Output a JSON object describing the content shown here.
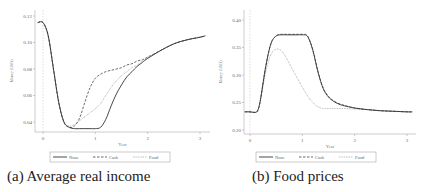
{
  "captions": {
    "a": "(a) Average real income",
    "b": "(b) Food prices"
  },
  "chart_data": [
    {
      "type": "line",
      "title": "(a) Average real income",
      "xlabel": "Year",
      "ylabel": "Money (USD)",
      "xlim": [
        -0.1,
        3.1
      ],
      "ylim": [
        0.033,
        0.12
      ],
      "xticks": [
        0,
        1,
        2,
        3
      ],
      "yticks": [
        0.04,
        0.06,
        0.08,
        0.1,
        0.12
      ],
      "ytick_labels": [
        "0.04",
        "0.06",
        "0.08",
        "0.10",
        "0.12"
      ],
      "vline_x": 0,
      "legend_position": "bottom",
      "x": [
        -0.1,
        0,
        0.1,
        0.2,
        0.3,
        0.4,
        0.5,
        0.6,
        0.7,
        0.8,
        0.9,
        1.0,
        1.1,
        1.2,
        1.3,
        1.4,
        1.5,
        1.6,
        1.7,
        1.8,
        1.9,
        2.0,
        2.25,
        2.5,
        2.75,
        3.0,
        3.1
      ],
      "series": [
        {
          "name": "None",
          "style": "solid",
          "values": [
            0.115,
            0.115,
            0.105,
            0.08,
            0.055,
            0.04,
            0.036,
            0.035,
            0.035,
            0.035,
            0.035,
            0.035,
            0.036,
            0.042,
            0.052,
            0.061,
            0.068,
            0.074,
            0.078,
            0.082,
            0.085,
            0.088,
            0.094,
            0.099,
            0.102,
            0.104,
            0.105
          ]
        },
        {
          "name": "Cash",
          "style": "dashed",
          "values": [
            0.115,
            0.115,
            0.105,
            0.08,
            0.055,
            0.04,
            0.036,
            0.037,
            0.043,
            0.055,
            0.066,
            0.073,
            0.076,
            0.078,
            0.079,
            0.08,
            0.081,
            0.083,
            0.084,
            0.086,
            0.087,
            0.089,
            0.094,
            0.099,
            0.102,
            0.104,
            0.105
          ]
        },
        {
          "name": "Food",
          "style": "dotted",
          "values": [
            0.115,
            0.115,
            0.105,
            0.08,
            0.055,
            0.04,
            0.037,
            0.038,
            0.041,
            0.044,
            0.047,
            0.05,
            0.054,
            0.06,
            0.066,
            0.071,
            0.075,
            0.078,
            0.081,
            0.083,
            0.086,
            0.088,
            0.094,
            0.099,
            0.102,
            0.104,
            0.105
          ]
        }
      ]
    },
    {
      "type": "line",
      "title": "(b) Food prices",
      "xlabel": "Year",
      "ylabel": "Money (USD)",
      "xlim": [
        -0.1,
        3.1
      ],
      "ylim": [
        0.2,
        0.4
      ],
      "xticks": [
        0,
        1,
        2,
        3
      ],
      "yticks": [
        0.2,
        0.25,
        0.3,
        0.35,
        0.4
      ],
      "ytick_labels": [
        "0.20",
        "0.25",
        "0.30",
        "0.35",
        "0.40"
      ],
      "vline_x": 0,
      "legend_position": "bottom",
      "x": [
        -0.1,
        0,
        0.1,
        0.15,
        0.2,
        0.3,
        0.4,
        0.5,
        0.6,
        0.7,
        0.8,
        0.9,
        1.0,
        1.1,
        1.2,
        1.3,
        1.4,
        1.5,
        1.6,
        1.7,
        1.8,
        2.0,
        2.25,
        2.5,
        2.75,
        3.0,
        3.1
      ],
      "series": [
        {
          "name": "None",
          "style": "solid",
          "values": [
            0.233,
            0.233,
            0.232,
            0.236,
            0.255,
            0.315,
            0.357,
            0.371,
            0.373,
            0.373,
            0.373,
            0.373,
            0.373,
            0.37,
            0.345,
            0.305,
            0.275,
            0.26,
            0.252,
            0.247,
            0.244,
            0.24,
            0.237,
            0.235,
            0.234,
            0.233,
            0.233
          ]
        },
        {
          "name": "Cash",
          "style": "dashed",
          "values": [
            0.233,
            0.233,
            0.232,
            0.236,
            0.255,
            0.315,
            0.357,
            0.371,
            0.374,
            0.374,
            0.374,
            0.374,
            0.374,
            0.371,
            0.346,
            0.306,
            0.276,
            0.261,
            0.253,
            0.248,
            0.245,
            0.24,
            0.237,
            0.235,
            0.234,
            0.233,
            0.233
          ]
        },
        {
          "name": "Food",
          "style": "dotted",
          "values": [
            0.233,
            0.233,
            0.232,
            0.236,
            0.255,
            0.305,
            0.337,
            0.347,
            0.344,
            0.33,
            0.312,
            0.295,
            0.278,
            0.262,
            0.25,
            0.242,
            0.239,
            0.239,
            0.239,
            0.239,
            0.239,
            0.238,
            0.237,
            0.235,
            0.234,
            0.233,
            0.233
          ]
        }
      ]
    }
  ]
}
